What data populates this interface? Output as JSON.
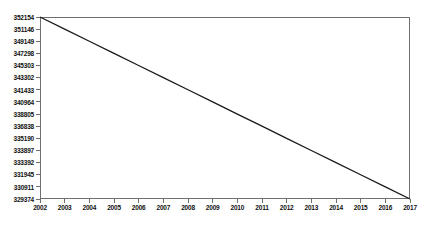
{
  "chart_data": {
    "type": "line",
    "title": "",
    "subtitle": "",
    "xlabel": "",
    "ylabel": "",
    "legend": [],
    "legend_position": "none",
    "grid": false,
    "x": [
      2002,
      2003,
      2004,
      2005,
      2006,
      2007,
      2008,
      2009,
      2010,
      2011,
      2012,
      2013,
      2014,
      2015,
      2016,
      2017
    ],
    "xticklabels": [
      "2002",
      "2003",
      "2004",
      "2005",
      "2006",
      "2007",
      "2008",
      "2009",
      "2010",
      "2011",
      "2012",
      "2013",
      "2014",
      "2015",
      "2016",
      "2017"
    ],
    "values": [
      352154,
      350635,
      349117,
      347598,
      346080,
      344561,
      343043,
      341524,
      340006,
      338487,
      336969,
      335450,
      333932,
      332413,
      330895,
      329374
    ],
    "yticklabels": [
      "352154",
      "351146",
      "349149",
      "347298",
      "345303",
      "343302",
      "341433",
      "340964",
      "338805",
      "336838",
      "335190",
      "333897",
      "333392",
      "331945",
      "330911",
      "329374"
    ],
    "ytickvalues": [
      352154,
      351146,
      349149,
      347298,
      345303,
      343302,
      341433,
      340964,
      338805,
      336838,
      335190,
      333897,
      333392,
      331945,
      330911,
      329374
    ],
    "ylim": [
      329374,
      352154
    ],
    "xlim": [
      2002,
      2017
    ],
    "series_color": "#1a1a1a",
    "axis_color": "#6f6f6f",
    "background_color": "#ffffff",
    "label_color": "#101010"
  }
}
